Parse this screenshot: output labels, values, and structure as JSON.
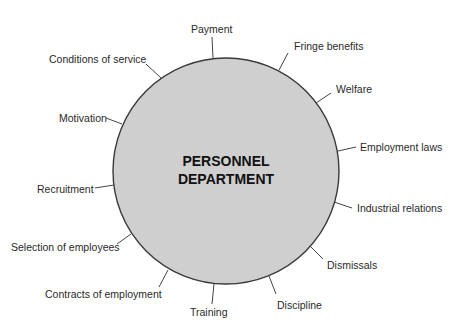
{
  "diagram": {
    "center": {
      "line1": "PERSONNEL",
      "line2": "DEPARTMENT"
    },
    "colors": {
      "circle_fill": "#cfcfcf",
      "circle_stroke": "#3a3a3a",
      "text": "#2a2a2a"
    },
    "functions": [
      {
        "id": "payment",
        "label": "Payment"
      },
      {
        "id": "fringe-benefits",
        "label": "Fringe benefits"
      },
      {
        "id": "welfare",
        "label": "Welfare"
      },
      {
        "id": "employment-laws",
        "label": "Employment laws"
      },
      {
        "id": "industrial-relations",
        "label": "Industrial relations"
      },
      {
        "id": "dismissals",
        "label": "Dismissals"
      },
      {
        "id": "discipline",
        "label": "Discipline"
      },
      {
        "id": "training",
        "label": "Training"
      },
      {
        "id": "contracts-of-employment",
        "label": "Contracts of employment"
      },
      {
        "id": "selection-of-employees",
        "label": "Selection of employees"
      },
      {
        "id": "recruitment",
        "label": "Recruitment"
      },
      {
        "id": "motivation",
        "label": "Motivation"
      },
      {
        "id": "conditions-of-service",
        "label": "Conditions of service"
      }
    ]
  }
}
